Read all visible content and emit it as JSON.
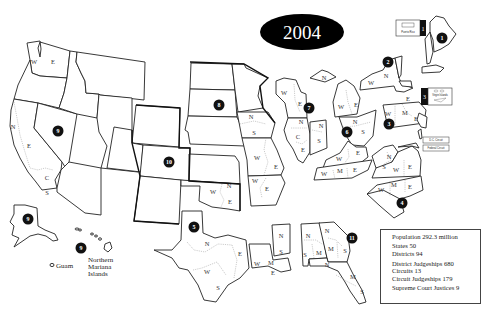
{
  "title": "2004",
  "stats": {
    "population": "Population 292.3 million",
    "states": "States 50",
    "districts": "Districts 94",
    "district_judgeships": "District Judgeships 680",
    "circuits": "Circuits 13",
    "circuit_judgeships": "Circuit Judgeships 179",
    "supreme_court_justices": "Supreme Court Justices 9"
  },
  "insets": {
    "puerto_rico": "Puerto Rico",
    "virgin_islands": "Virgin Islands",
    "dc_circuit": "D.C. Circuit",
    "federal_circuit": "Federal Circuit",
    "guam": "Guam",
    "northern_mariana_islands": [
      "Northern",
      "Mariana",
      "Islands"
    ]
  },
  "circuits": [
    {
      "id": "1",
      "x": 442,
      "y": 38
    },
    {
      "id": "2",
      "x": 388,
      "y": 62
    },
    {
      "id": "3",
      "x": 389,
      "y": 124
    },
    {
      "id": "3",
      "x": 424,
      "y": 96,
      "inset": true
    },
    {
      "id": "4",
      "x": 402,
      "y": 203
    },
    {
      "id": "5",
      "x": 194,
      "y": 227
    },
    {
      "id": "6",
      "x": 347,
      "y": 132
    },
    {
      "id": "7",
      "x": 309,
      "y": 108
    },
    {
      "id": "8",
      "x": 219,
      "y": 105
    },
    {
      "id": "9",
      "x": 58,
      "y": 131
    },
    {
      "id": "9",
      "x": 28,
      "y": 219
    },
    {
      "id": "9",
      "x": 81,
      "y": 248
    },
    {
      "id": "10",
      "x": 169,
      "y": 162
    },
    {
      "id": "11",
      "x": 352,
      "y": 238
    },
    {
      "id": "1",
      "x": 423,
      "y": 29,
      "inset": true
    }
  ],
  "district_labels": [
    {
      "t": "W",
      "x": 34,
      "y": 62
    },
    {
      "t": "E",
      "x": 53,
      "y": 62
    },
    {
      "t": "N",
      "x": 13,
      "y": 127
    },
    {
      "t": "E",
      "x": 29,
      "y": 146
    },
    {
      "t": "C",
      "x": 47,
      "y": 178
    },
    {
      "t": "S",
      "x": 47,
      "y": 193
    },
    {
      "t": "N",
      "x": 251,
      "y": 117
    },
    {
      "t": "S",
      "x": 254,
      "y": 133
    },
    {
      "t": "W",
      "x": 257,
      "y": 158
    },
    {
      "t": "E",
      "x": 276,
      "y": 167
    },
    {
      "t": "W",
      "x": 255,
      "y": 181
    },
    {
      "t": "E",
      "x": 267,
      "y": 189
    },
    {
      "t": "W",
      "x": 213,
      "y": 192
    },
    {
      "t": "N",
      "x": 229,
      "y": 186
    },
    {
      "t": "E",
      "x": 230,
      "y": 202
    },
    {
      "t": "N",
      "x": 207,
      "y": 244
    },
    {
      "t": "E",
      "x": 240,
      "y": 254
    },
    {
      "t": "W",
      "x": 207,
      "y": 272
    },
    {
      "t": "S",
      "x": 218,
      "y": 288
    },
    {
      "t": "W",
      "x": 257,
      "y": 264
    },
    {
      "t": "M",
      "x": 271,
      "y": 263
    },
    {
      "t": "E",
      "x": 273,
      "y": 273
    },
    {
      "t": "N",
      "x": 281,
      "y": 236
    },
    {
      "t": "S",
      "x": 281,
      "y": 252
    },
    {
      "t": "W",
      "x": 284,
      "y": 93
    },
    {
      "t": "E",
      "x": 300,
      "y": 104
    },
    {
      "t": "N",
      "x": 301,
      "y": 122
    },
    {
      "t": "C",
      "x": 298,
      "y": 137
    },
    {
      "t": "E",
      "x": 303,
      "y": 150
    },
    {
      "t": "N",
      "x": 321,
      "y": 126
    },
    {
      "t": "S",
      "x": 319,
      "y": 141
    },
    {
      "t": "N",
      "x": 324,
      "y": 78
    },
    {
      "t": "W",
      "x": 341,
      "y": 107
    },
    {
      "t": "E",
      "x": 356,
      "y": 105
    },
    {
      "t": "N",
      "x": 355,
      "y": 122
    },
    {
      "t": "S",
      "x": 363,
      "y": 132
    },
    {
      "t": "W",
      "x": 339,
      "y": 159
    },
    {
      "t": "E",
      "x": 358,
      "y": 153
    },
    {
      "t": "W",
      "x": 324,
      "y": 174
    },
    {
      "t": "M",
      "x": 340,
      "y": 171
    },
    {
      "t": "E",
      "x": 355,
      "y": 170
    },
    {
      "t": "W",
      "x": 371,
      "y": 83
    },
    {
      "t": "N",
      "x": 386,
      "y": 76
    },
    {
      "t": "E",
      "x": 408,
      "y": 99
    },
    {
      "t": "W",
      "x": 388,
      "y": 114
    },
    {
      "t": "M",
      "x": 405,
      "y": 113
    },
    {
      "t": "E",
      "x": 416,
      "y": 119
    },
    {
      "t": "N",
      "x": 389,
      "y": 157
    },
    {
      "t": "S",
      "x": 384,
      "y": 167
    },
    {
      "t": "W",
      "x": 396,
      "y": 170
    },
    {
      "t": "E",
      "x": 410,
      "y": 167
    },
    {
      "t": "W",
      "x": 381,
      "y": 190
    },
    {
      "t": "M",
      "x": 394,
      "y": 185
    },
    {
      "t": "E",
      "x": 410,
      "y": 187
    },
    {
      "t": "N",
      "x": 308,
      "y": 236
    },
    {
      "t": "S",
      "x": 305,
      "y": 255
    },
    {
      "t": "M",
      "x": 319,
      "y": 253
    },
    {
      "t": "N",
      "x": 327,
      "y": 231
    },
    {
      "t": "M",
      "x": 331,
      "y": 249
    },
    {
      "t": "S",
      "x": 345,
      "y": 251
    },
    {
      "t": "N",
      "x": 327,
      "y": 265
    },
    {
      "t": "M",
      "x": 353,
      "y": 277
    },
    {
      "t": "S",
      "x": 362,
      "y": 292
    }
  ]
}
